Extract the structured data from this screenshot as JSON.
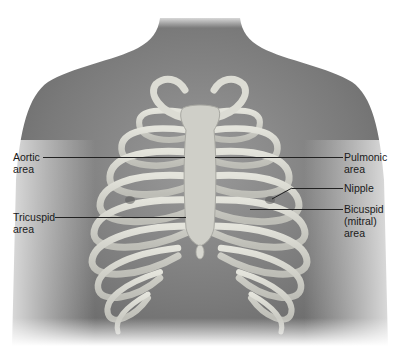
{
  "figure": {
    "type": "anatomical-illustration",
    "palette": {
      "background": "#ffffff",
      "skin_dark": "#6e6e6e",
      "skin_mid": "#8c8c8c",
      "skin_light": "#b5b5b5",
      "bone": "#d8d8d0",
      "bone_shadow": "#9a9a94",
      "leader_line": "#222222",
      "label_text": "#1a1a1a"
    }
  },
  "labels": {
    "aortic": {
      "line1": "Aortic",
      "line2": "area"
    },
    "tricuspid": {
      "line1": "Tricuspid",
      "line2": "area"
    },
    "pulmonic": {
      "line1": "Pulmonic",
      "line2": "area"
    },
    "nipple": {
      "line1": "Nipple"
    },
    "bicuspid": {
      "line1": "Bicuspid",
      "line2": "(mitral)",
      "line3": "area"
    }
  }
}
